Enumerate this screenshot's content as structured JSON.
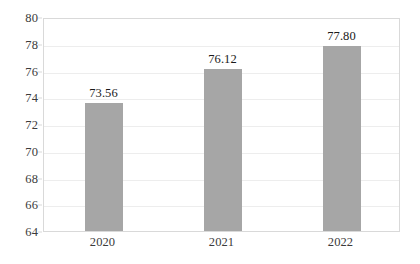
{
  "chart_data": {
    "type": "bar",
    "title": "",
    "subtitle": "",
    "xlabel": "",
    "ylabel": "",
    "categories": [
      "2020",
      "2021",
      "2022"
    ],
    "values": [
      73.56,
      76.12,
      77.8
    ],
    "data_labels": [
      "73.56",
      "76.12",
      "77.80"
    ],
    "ylim": [
      64,
      80
    ],
    "ytick_step": 2,
    "ytick_labels": [
      "80",
      "78",
      "76",
      "74",
      "72",
      "70",
      "68",
      "66",
      "64"
    ],
    "ytick_values": [
      80,
      78,
      76,
      74,
      72,
      70,
      68,
      66,
      64
    ],
    "grid": true,
    "grid_axis": "y",
    "legend": false,
    "legend_position": "none",
    "series": [
      {
        "name": "",
        "values": [
          73.56,
          76.12,
          77.8
        ],
        "color": "#a6a6a6"
      }
    ],
    "colors": {
      "bar_fill": "#a6a6a6",
      "gridline": "#ededed",
      "plot_border": "#d9d9d9",
      "tick_label": "#3b3b3b",
      "data_label": "#1a1a1a",
      "background": "#ffffff"
    }
  }
}
